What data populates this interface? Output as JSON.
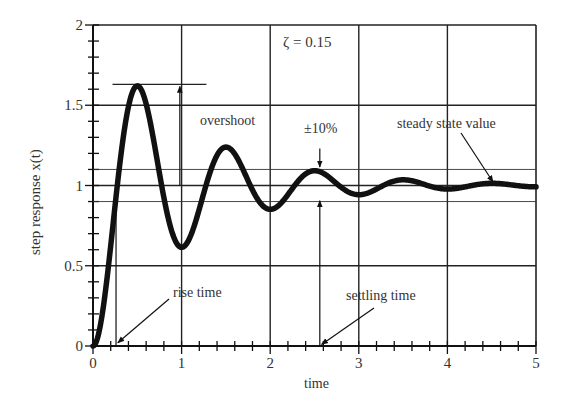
{
  "chart_data": {
    "type": "line",
    "title": "",
    "xlabel": "time",
    "ylabel": "step response x(t)",
    "xlim": [
      0,
      5
    ],
    "ylim": [
      0,
      2
    ],
    "grid": true,
    "xticks": [
      "0",
      "1",
      "2",
      "3",
      "4",
      "5"
    ],
    "yticks": [
      "0",
      "0.5",
      "1",
      "1.5",
      "2"
    ],
    "parameter": "ζ = 0.15",
    "series": [
      {
        "name": "step response",
        "damping_ratio": 0.15,
        "natural_frequency": 6.35,
        "x": [
          0,
          0.25,
          0.5,
          0.75,
          1.0,
          1.25,
          1.5,
          1.75,
          2.0,
          2.5,
          3.0,
          3.5,
          4.0,
          4.5,
          5.0
        ],
        "values": [
          0,
          0.75,
          1.62,
          1.3,
          0.62,
          0.82,
          1.23,
          1.05,
          0.85,
          1.09,
          0.94,
          1.03,
          0.96,
          1.0,
          0.98
        ]
      }
    ],
    "reference_lines": {
      "steady_state": 1.0,
      "band_upper": 1.1,
      "band_lower": 0.9,
      "overshoot_peak": 1.63
    },
    "annotations": [
      {
        "text": "overshoot",
        "x": 1.0,
        "y": 1.5
      },
      {
        "text": "±10%",
        "x": 2.55,
        "y": 1.2
      },
      {
        "text": "steady state value",
        "x": 4.5,
        "y": 1.2
      },
      {
        "text": "rise time",
        "x": 0.25,
        "y": 0.1
      },
      {
        "text": "settling time",
        "x": 2.55,
        "y": 0.0
      }
    ]
  },
  "labels": {
    "zeta": "ζ = 0.15",
    "overshoot": "overshoot",
    "band": "±10%",
    "steady_state": "steady state value",
    "rise_time": "rise time",
    "settling_time": "settling time",
    "xlabel": "time",
    "ylabel": "step response x(t)"
  }
}
